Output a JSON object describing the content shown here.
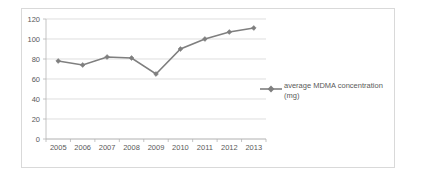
{
  "chart_data": {
    "type": "line",
    "title": "",
    "xlabel": "",
    "ylabel": "",
    "categories": [
      "2005",
      "2006",
      "2007",
      "2008",
      "2009",
      "2010",
      "2011",
      "2012",
      "2013"
    ],
    "series": [
      {
        "name": "average MDMA concentration (mg)",
        "values": [
          78,
          74,
          82,
          81,
          65,
          90,
          100,
          107,
          111
        ]
      }
    ],
    "ylim": [
      0,
      120
    ],
    "ytick_labels": [
      "120",
      "100",
      "80",
      "60",
      "40",
      "20",
      "0"
    ],
    "ytick_values": [
      120,
      100,
      80,
      60,
      40,
      20,
      0
    ],
    "grid": true,
    "legend_position": "right",
    "legend_entries": [
      "average MDMA concentration",
      "(mg)"
    ],
    "colors": {
      "series": "#7f7f7f",
      "gridline": "#d0d0d0",
      "axis": "#b5b5b5",
      "text": "#595959",
      "border": "#d9d9d9",
      "background": "#ffffff"
    }
  },
  "legend": {
    "line1": "average MDMA concentration",
    "line2": "(mg)"
  }
}
